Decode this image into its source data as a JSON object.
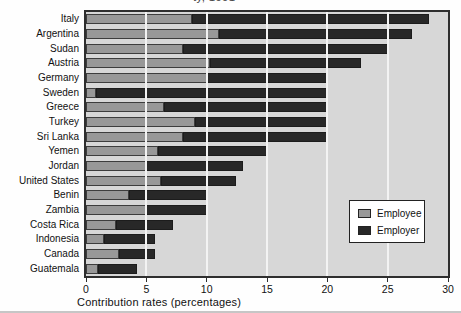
{
  "title_fragment": "ty, 1991",
  "x_axis": {
    "label": "Contribution rates (percentages)",
    "ticks": [
      0,
      5,
      10,
      15,
      20,
      25,
      30
    ],
    "min": 0,
    "max": 30
  },
  "legend": {
    "items": [
      {
        "label": "Employee",
        "color": "#989898"
      },
      {
        "label": "Employer",
        "color": "#282828"
      }
    ]
  },
  "colors": {
    "plot_background": "#d7d7d7",
    "gridline": "#f3f3f3",
    "employee_bar": "#989898",
    "employer_bar": "#282828",
    "plot_border": "#2e2e2e"
  },
  "chart_data": {
    "type": "bar",
    "orientation": "horizontal",
    "stacked": true,
    "xlabel": "Contribution rates (percentages)",
    "ylabel": "",
    "xlim": [
      0,
      30
    ],
    "grid": "vertical white gridlines at 5,10,15,20,25 drawn over bars",
    "legend_position": "right-middle",
    "categories": [
      "Italy",
      "Argentina",
      "Sudan",
      "Austria",
      "Germany",
      "Sweden",
      "Greece",
      "Turkey",
      "Sri Lanka",
      "Yemen",
      "Jordan",
      "United States",
      "Benin",
      "Zambia",
      "Costa Rica",
      "Indonesia",
      "Canada",
      "Guatemala"
    ],
    "series": [
      {
        "name": "Employee",
        "color": "#989898",
        "values": [
          8.8,
          11,
          8,
          10.25,
          10,
          0.8,
          6.5,
          9,
          8,
          6,
          5,
          6.2,
          3.6,
          5,
          2.5,
          1.5,
          2.7,
          1
        ]
      },
      {
        "name": "Employer",
        "color": "#282828",
        "values": [
          19.6,
          16,
          17,
          12.55,
          10,
          19.2,
          13.5,
          11,
          12,
          9,
          8,
          6.2,
          6.4,
          5,
          4.75,
          4.2,
          3,
          3.2
        ]
      }
    ],
    "totals": [
      28.4,
      27,
      25,
      22.8,
      20,
      20,
      20,
      20,
      20,
      15,
      13,
      12.4,
      10,
      10,
      7.25,
      5.7,
      5.7,
      4.2
    ]
  }
}
